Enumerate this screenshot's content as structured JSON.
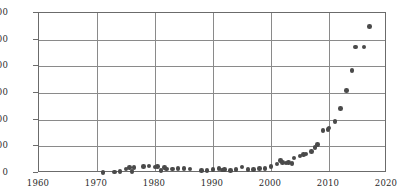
{
  "chart_data": {
    "type": "scatter",
    "title": "",
    "subtitle": "",
    "xlabel": "",
    "ylabel": "",
    "xlim": [
      1960,
      2020
    ],
    "ylim": [
      0,
      1200
    ],
    "xticks": [
      1960,
      1970,
      1980,
      1990,
      2000,
      2010,
      2020
    ],
    "xtick_labels": [
      "1960",
      "1970",
      "1980",
      "1990",
      "2000",
      "2010",
      "2020"
    ],
    "yticks": [
      0,
      200,
      400,
      600,
      800,
      1000,
      1200
    ],
    "ytick_labels": [
      "0",
      "200",
      "400",
      "600",
      "800",
      "1000",
      "1200"
    ],
    "grid": "both",
    "legend": "none",
    "marker_color": "#4a4a4a",
    "grid_color": "#8a8a8a",
    "frame_color": "#6b6b6b",
    "series": [
      {
        "name": "series-1",
        "points": [
          [
            1971,
            5
          ],
          [
            1973,
            8
          ],
          [
            1974,
            10
          ],
          [
            1975,
            30
          ],
          [
            1975.6,
            42
          ],
          [
            1976,
            12
          ],
          [
            1976.4,
            40
          ],
          [
            1978,
            48
          ],
          [
            1979,
            52
          ],
          [
            1980,
            44
          ],
          [
            1980.4,
            48
          ],
          [
            1981,
            20
          ],
          [
            1981.6,
            42
          ],
          [
            1982,
            30
          ],
          [
            1983,
            30
          ],
          [
            1984,
            34
          ],
          [
            1985,
            32
          ],
          [
            1986,
            30
          ],
          [
            1988,
            18
          ],
          [
            1989,
            20
          ],
          [
            1990,
            26
          ],
          [
            1991,
            34
          ],
          [
            1991.6,
            22
          ],
          [
            1992,
            26
          ],
          [
            1993,
            20
          ],
          [
            1994,
            28
          ],
          [
            1995,
            44
          ],
          [
            1996,
            28
          ],
          [
            1997,
            26
          ],
          [
            1998,
            32
          ],
          [
            1999,
            34
          ],
          [
            2000,
            50
          ],
          [
            2001,
            66
          ],
          [
            2001.6,
            92
          ],
          [
            2002,
            78
          ],
          [
            2002.6,
            74
          ],
          [
            2003,
            80
          ],
          [
            2003.6,
            70
          ],
          [
            2004,
            112
          ],
          [
            2005,
            128
          ],
          [
            2005.6,
            140
          ],
          [
            2006,
            142
          ],
          [
            2007,
            160
          ],
          [
            2007.6,
            190
          ],
          [
            2008,
            212
          ],
          [
            2009,
            318
          ],
          [
            2009.8,
            326
          ],
          [
            2010,
            338
          ],
          [
            2011,
            386
          ],
          [
            2012,
            484
          ],
          [
            2013,
            620
          ],
          [
            2014,
            770
          ],
          [
            2014.6,
            945
          ],
          [
            2016,
            945
          ],
          [
            2017,
            1100
          ]
        ]
      }
    ]
  }
}
